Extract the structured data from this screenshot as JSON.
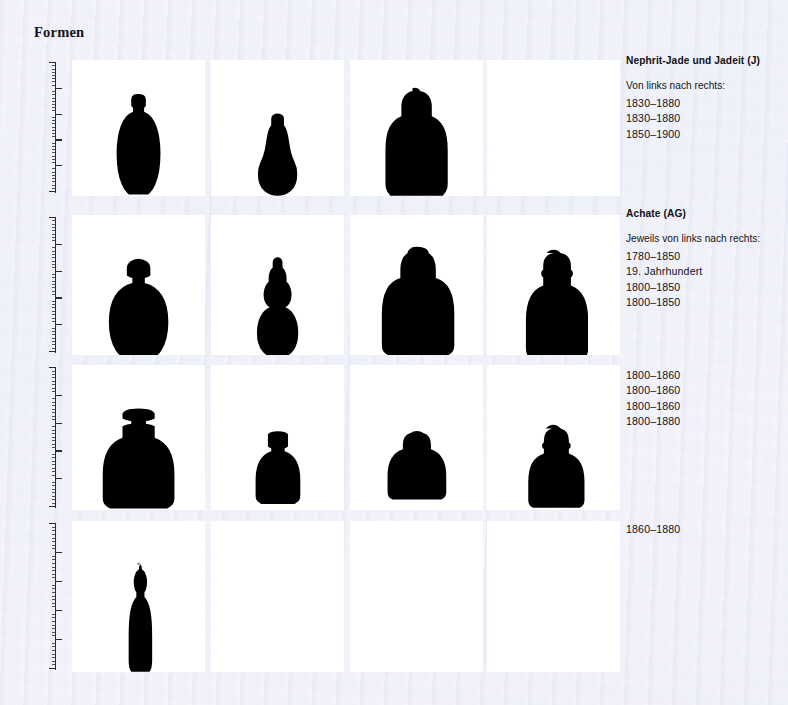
{
  "page": {
    "title": "Formen",
    "background_color": "#f3f1f7",
    "panel_color": "#ffffff",
    "silhouette_color": "#000000"
  },
  "captions": [
    {
      "id": "nephrite",
      "heading": "Nephrit-Jade und Jadeit (J)",
      "subtitle": "Von links nach rechts:",
      "dates": [
        "1830–1880",
        "1830–1880",
        "1850–1900"
      ]
    },
    {
      "id": "agate",
      "heading": "Achate (AG)",
      "subtitle": "Jeweils von links nach rechts:",
      "dates": [
        "1780–1850",
        "19. Jahrhundert",
        "1800–1850",
        "1800–1850"
      ]
    },
    {
      "id": "row3",
      "heading": "",
      "subtitle": "",
      "dates": [
        "1800–1860",
        "1800–1860",
        "1800–1860",
        "1800–1880"
      ]
    },
    {
      "id": "row4",
      "heading": "",
      "subtitle": "",
      "dates": [
        "1860–1880"
      ]
    }
  ],
  "rows": [
    {
      "id": "row-1",
      "ruler": {
        "major_ticks": 5,
        "minor_per_major": 8
      },
      "cells": [
        {
          "shape": "ovoid-bottle-with-stopper",
          "filled": true
        },
        {
          "shape": "pear-bottle-with-stopper",
          "filled": true
        },
        {
          "shape": "broad-shouldered-bottle-with-stopper",
          "filled": true
        },
        {
          "shape": "empty",
          "filled": false
        }
      ]
    },
    {
      "id": "row-2",
      "ruler": {
        "major_ticks": 5,
        "minor_per_major": 8
      },
      "cells": [
        {
          "shape": "round-bodied-bottle-with-stopper",
          "filled": true
        },
        {
          "shape": "double-gourd-bottle-with-stopper",
          "filled": true
        },
        {
          "shape": "wide-flask-bottle-with-stopper",
          "filled": true
        },
        {
          "shape": "tall-flask-bottle-with-stopper",
          "filled": true
        }
      ]
    },
    {
      "id": "row-3",
      "ruler": {
        "major_ticks": 5,
        "minor_per_major": 8
      },
      "cells": [
        {
          "shape": "cylindrical-neck-jar-bottle",
          "filled": true
        },
        {
          "shape": "small-cylindrical-neck-bottle",
          "filled": true
        },
        {
          "shape": "squat-flask-bottle-with-stopper",
          "filled": true
        },
        {
          "shape": "compact-flask-bottle-with-stopper",
          "filled": true
        }
      ]
    },
    {
      "id": "row-4",
      "ruler": {
        "major_ticks": 5,
        "minor_per_major": 8
      },
      "cells": [
        {
          "shape": "tall-slender-vase-bottle",
          "filled": true
        },
        {
          "shape": "empty",
          "filled": false
        },
        {
          "shape": "empty",
          "filled": false
        },
        {
          "shape": "empty",
          "filled": false
        }
      ]
    }
  ]
}
